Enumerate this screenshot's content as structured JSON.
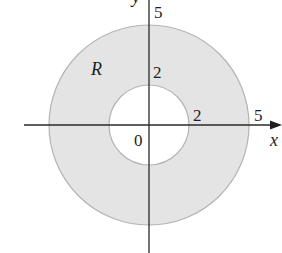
{
  "figure": {
    "colors": {
      "region_fill": "#e4e4e4",
      "circle_stroke": "#b4b4b4",
      "axis": "#2a2a2a",
      "background": "#ffffff"
    },
    "geometry": {
      "center": {
        "x": 149,
        "y": 125
      },
      "scale_px_per_unit": 20,
      "outer_radius": 5,
      "inner_radius": 2
    },
    "labels": {
      "region": "R",
      "y_axis_outer": "5",
      "y_axis_inner": "2",
      "x_axis_inner": "2",
      "x_axis_outer": "5",
      "origin": "0",
      "x_axis": "x",
      "y_axis": "y"
    }
  }
}
